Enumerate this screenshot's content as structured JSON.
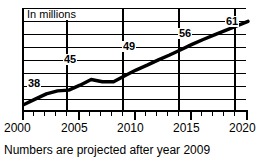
{
  "chart_data": {
    "type": "line",
    "title": "",
    "unit_label": "In millions",
    "caption": "Numbers are projected after year 2009",
    "xlabel": "",
    "ylabel": "",
    "xlim": [
      2000,
      2020
    ],
    "ylim": [
      36,
      63
    ],
    "grid": true,
    "legend": "none",
    "x_tick_labels": [
      "2000",
      "2005",
      "2010",
      "2015",
      "2020"
    ],
    "x_tick_values": [
      2000,
      2005,
      2010,
      2015,
      2020
    ],
    "x_minor_ticks": [
      2001,
      2002,
      2003,
      2004,
      2006,
      2007,
      2008,
      2009,
      2011,
      2012,
      2013,
      2014,
      2016,
      2017,
      2018,
      2019
    ],
    "gridline_count": 8,
    "series": [
      {
        "name": "Population",
        "color": "#000000",
        "x": [
          2000,
          2001,
          2002,
          2003,
          2004,
          2005,
          2006,
          2007,
          2008,
          2009,
          2010,
          2011,
          2012,
          2013,
          2014,
          2015,
          2016,
          2017,
          2018,
          2019,
          2020
        ],
        "values": [
          38,
          39.4,
          40.8,
          41.6,
          41.8,
          43.1,
          44.6,
          44.0,
          44.0,
          45.6,
          47.1,
          48.4,
          49.8,
          51.1,
          52.5,
          53.9,
          55.2,
          56.4,
          57.6,
          58.8,
          60.0
        ]
      }
    ],
    "point_labels": [
      {
        "text": "38",
        "x": 2000,
        "value": 38
      },
      {
        "text": "45",
        "x": 2005,
        "value": 45
      },
      {
        "text": "49",
        "x": 2010,
        "value": 49
      },
      {
        "text": "56",
        "x": 2015,
        "value": 56
      },
      {
        "text": "61",
        "x": 2020,
        "value": 61
      }
    ]
  }
}
